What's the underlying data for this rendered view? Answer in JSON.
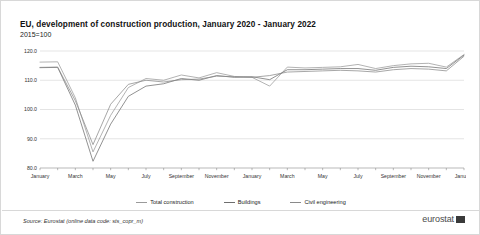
{
  "header": {
    "title": "EU, development of construction production, January 2020 - January 2022",
    "subtitle": "2015=100"
  },
  "footer": {
    "source": "Source: Eurostat (online data code: sts_copr_m)",
    "brand": "eurostat",
    "brand_mark_icon": "eurostat-logo-icon"
  },
  "legend": {
    "position": "bottom-center",
    "items": [
      {
        "label": "Total construction",
        "color": "#9a9a9a"
      },
      {
        "label": "Buildings",
        "color": "#6e6e6e"
      },
      {
        "label": "Civil engineering",
        "color": "#8a8a8a"
      }
    ]
  },
  "chart_data": {
    "type": "line",
    "title": "EU, development of construction production, January 2020 - January 2022",
    "subtitle": "2015=100",
    "xlabel": "",
    "ylabel": "",
    "ylim": [
      80.0,
      120.0
    ],
    "yticks": [
      80.0,
      90.0,
      100.0,
      110.0,
      120.0
    ],
    "ytick_labels": [
      "80.0",
      "90.0",
      "100.0",
      "110.0",
      "120.0"
    ],
    "grid": true,
    "x": [
      "January 2020",
      "February 2020",
      "March 2020",
      "April 2020",
      "May 2020",
      "June 2020",
      "July 2020",
      "August 2020",
      "September 2020",
      "October 2020",
      "November 2020",
      "December 2020",
      "January 2021",
      "February 2021",
      "March 2021",
      "April 2021",
      "May 2021",
      "June 2021",
      "July 2021",
      "August 2021",
      "September 2021",
      "October 2021",
      "November 2021",
      "December 2021",
      "January 2022"
    ],
    "xtick_labels": [
      "January",
      "March",
      "May",
      "July",
      "September",
      "November",
      "January",
      "March",
      "May",
      "July",
      "September",
      "November",
      "January"
    ],
    "series": [
      {
        "name": "Total construction",
        "color": "#9a9a9a",
        "values": [
          116.2,
          116.3,
          104.0,
          85.5,
          98.0,
          107.5,
          110.6,
          110.0,
          111.8,
          110.8,
          112.6,
          111.3,
          111.0,
          108.0,
          114.5,
          114.2,
          114.4,
          114.6,
          115.4,
          114.0,
          115.0,
          115.6,
          115.8,
          114.5,
          118.8
        ]
      },
      {
        "name": "Buildings",
        "color": "#6e6e6e",
        "values": [
          114.3,
          114.4,
          101.5,
          82.3,
          95.0,
          104.5,
          108.0,
          108.8,
          110.6,
          110.0,
          111.6,
          111.0,
          111.2,
          110.2,
          113.6,
          113.6,
          113.8,
          114.0,
          114.0,
          113.4,
          114.4,
          114.8,
          114.6,
          114.0,
          118.6
        ]
      },
      {
        "name": "Civil engineering",
        "color": "#8a8a8a",
        "values": [
          114.4,
          114.5,
          103.0,
          88.0,
          101.8,
          108.6,
          110.0,
          109.4,
          110.2,
          110.4,
          111.4,
          111.2,
          111.0,
          111.6,
          112.8,
          113.0,
          113.2,
          113.4,
          113.2,
          112.8,
          113.6,
          114.0,
          113.8,
          113.2,
          118.2
        ]
      }
    ]
  }
}
